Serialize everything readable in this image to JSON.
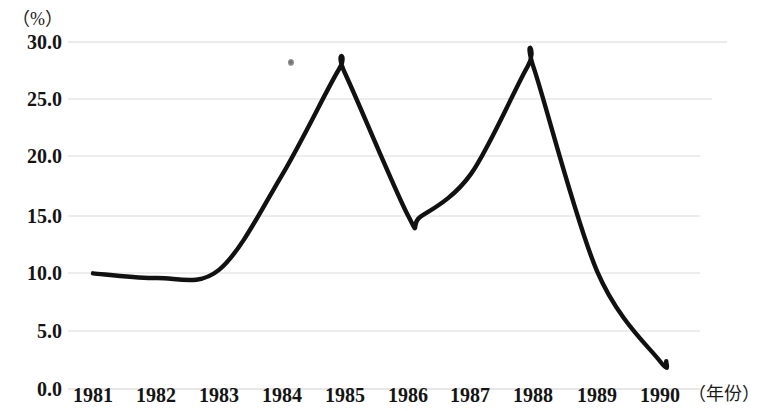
{
  "chart_data": {
    "type": "line",
    "title": "",
    "subtitle": "",
    "xlabel": "（年份）",
    "ylabel": "（%）",
    "x": [
      1981,
      1982,
      1983,
      1984,
      1985,
      1986,
      1987,
      1988,
      1989,
      1990
    ],
    "categories": [
      "1981",
      "1982",
      "1983",
      "1984",
      "1985",
      "1986",
      "1987",
      "1988",
      "1989",
      "1990"
    ],
    "series": [
      {
        "name": "",
        "values": [
          10.0,
          9.6,
          10.3,
          18.5,
          27.3,
          15.0,
          18.6,
          27.7,
          10.2,
          2.4
        ]
      }
    ],
    "peaks": [
      {
        "label": "first-peak",
        "x": 1984.9,
        "y": 27.6
      },
      {
        "label": "second-peak",
        "x": 1987.9,
        "y": 27.9
      }
    ],
    "troughs": [
      {
        "label": "early-dip",
        "x": 1982.0,
        "y": 9.6
      },
      {
        "label": "mid-valley",
        "x": 1986.2,
        "y": 14.9
      }
    ],
    "end_point": {
      "x": 1990.1,
      "y": 2.4
    },
    "ylim": [
      0.0,
      30.0
    ],
    "xlim": [
      1980.75,
      1990.4
    ],
    "ytick_labels": [
      "0.0",
      "5.0",
      "10.0",
      "15.0",
      "20.0",
      "25.0",
      "30.0"
    ],
    "ytick_values": [
      0.0,
      5.0,
      10.0,
      15.0,
      20.0,
      25.0,
      30.0
    ],
    "grid": true,
    "grid_axis": "y",
    "legend": false,
    "legend_position": "none",
    "line_color": "#111111",
    "grid_color": "#d8d8d8",
    "background_color": "#ffffff",
    "annotations": [
      {
        "name": "scan-speck",
        "x_px": 291,
        "y_px": 62
      }
    ]
  }
}
